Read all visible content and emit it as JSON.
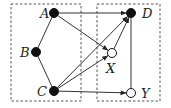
{
  "diagram": {
    "title": "",
    "colors": {
      "stroke": "#333333",
      "box": "#555555",
      "filled": "#111111",
      "open": "#ffffff"
    },
    "boxes": [
      {
        "id": "left-box",
        "x": 11,
        "y": 4,
        "w": 70,
        "h": 97
      },
      {
        "id": "right-box",
        "x": 97,
        "y": 4,
        "w": 63,
        "h": 97
      }
    ],
    "nodes": [
      {
        "id": "A",
        "label": "A",
        "x": 54,
        "y": 13,
        "filled": true,
        "lx": 40,
        "ly": 18
      },
      {
        "id": "B",
        "label": "B",
        "x": 36,
        "y": 52,
        "filled": true,
        "lx": 20,
        "ly": 57
      },
      {
        "id": "C",
        "label": "C",
        "x": 54,
        "y": 91,
        "filled": true,
        "lx": 37,
        "ly": 96
      },
      {
        "id": "D",
        "label": "D",
        "x": 131,
        "y": 13,
        "filled": true,
        "lx": 142,
        "ly": 18
      },
      {
        "id": "X",
        "label": "X",
        "x": 112,
        "y": 53,
        "filled": false,
        "lx": 106,
        "ly": 73
      },
      {
        "id": "Y",
        "label": "Y",
        "x": 131,
        "y": 93,
        "filled": false,
        "lx": 141,
        "ly": 98
      }
    ],
    "edges": [
      {
        "from": "A",
        "to": "B",
        "directed": false
      },
      {
        "from": "B",
        "to": "C",
        "directed": false
      },
      {
        "from": "A",
        "to": "D",
        "directed": true
      },
      {
        "from": "A",
        "to": "X",
        "directed": true
      },
      {
        "from": "C",
        "to": "D",
        "directed": true
      },
      {
        "from": "C",
        "to": "X",
        "directed": true
      },
      {
        "from": "X",
        "to": "D",
        "directed": true
      },
      {
        "from": "D",
        "to": "Y",
        "directed": false
      },
      {
        "from": "C",
        "to": "Y",
        "directed": true
      }
    ]
  }
}
